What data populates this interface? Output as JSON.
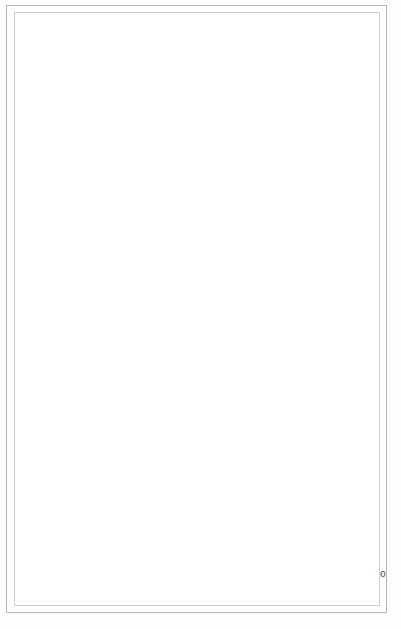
{
  "chart_data": {
    "type": "bar",
    "orientation": "horizontal",
    "title": "",
    "xlabel": "Percent with that characteristic",
    "ylabel": "School facility",
    "xlim": [
      0,
      100
    ],
    "xticks": [
      0,
      10,
      20,
      30,
      40,
      50,
      60,
      70,
      80,
      90,
      100
    ],
    "grid": true,
    "legend_position": "right-middle",
    "categories": [
      "Age of building less than 20 years old",
      "Cafeteria",
      "Full-time librarian",
      "Free textbooks",
      "Sufficient number of textbooks",
      "Central school library",
      "Free lunch program",
      "Music teacher",
      "Accelerated curriculum",
      "Low IQ classes",
      "Use of tracking",
      "School newspaper",
      "Band"
    ],
    "series": [
      {
        "name": "Black",
        "color": "#121212",
        "values": [
          63,
          38,
          30,
          84,
          84,
          73,
          74,
          24,
          29,
          54,
          44,
          28,
          66
        ]
      },
      {
        "name": "White",
        "color": "#fbfbfb",
        "values": [
          60,
          37,
          22,
          75,
          96,
          72,
          50,
          35,
          40,
          48,
          36,
          29,
          72
        ]
      }
    ]
  },
  "axis": {
    "x_title": "Percent with that characteristic",
    "y_corner_label": "School facility",
    "tick_labels": [
      "0",
      "10",
      "20",
      "30",
      "40",
      "50",
      "60",
      "70",
      "80",
      "90",
      "100"
    ]
  },
  "legend": {
    "entries": [
      {
        "label": "Black",
        "swatch": "black-swatch"
      },
      {
        "label": "White",
        "swatch": "white-swatch"
      }
    ]
  },
  "category_labels": [
    "Age of building less\nthan 20 years old",
    "Cafeteria",
    "Full-time librarian",
    "Free textbooks",
    "Sufficient number\nof textbooks",
    "Central school library",
    "Free lunch program",
    "Music teacher",
    "Accelerated curriculum",
    "Low IQ classes",
    "Use of tracking",
    "School newspaper",
    "Band"
  ],
  "value_labels": {
    "black": [
      "63",
      "38",
      "30",
      "84",
      "84",
      "73",
      "74",
      "24",
      "29",
      "54",
      "44",
      "28",
      "66"
    ],
    "white": [
      "60",
      "37",
      "22",
      "75",
      "96",
      "72",
      "50",
      "35",
      "40",
      "48",
      "36",
      "29",
      "72"
    ]
  },
  "colors": {
    "plot_background": "#9a9a9a",
    "gridline": "#f2f2f2",
    "black_series": "#121212",
    "white_series": "#fbfbfb",
    "label_text": "#4c4c4c",
    "frame": "#b9b9b9"
  }
}
